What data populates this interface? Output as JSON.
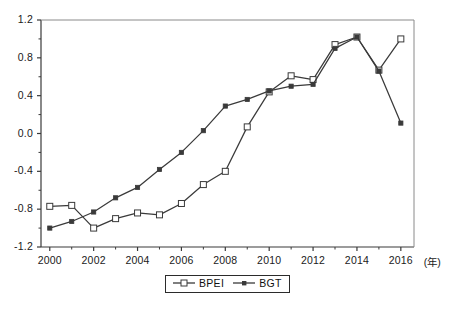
{
  "chart_data": {
    "type": "line",
    "title": "",
    "subtitle": "",
    "xlabel": "(年)",
    "ylabel": "",
    "x": [
      2000,
      2001,
      2002,
      2003,
      2004,
      2005,
      2006,
      2007,
      2008,
      2009,
      2010,
      2011,
      2012,
      2013,
      2014,
      2015,
      2016
    ],
    "xtick_labels": [
      "2000",
      "2002",
      "2004",
      "2006",
      "2008",
      "2010",
      "2012",
      "2014",
      "2016"
    ],
    "xtick_values": [
      2000,
      2002,
      2004,
      2006,
      2008,
      2010,
      2012,
      2014,
      2016
    ],
    "ytick_labels": [
      "1.2",
      "0.8",
      "0.4",
      "0.0",
      "-0.4",
      "-0.8",
      "-1.2"
    ],
    "ytick_values": [
      1.2,
      0.8,
      0.4,
      0.0,
      -0.4,
      -0.8,
      -1.2
    ],
    "xlim": [
      1999.6,
      2016.6
    ],
    "ylim": [
      -1.2,
      1.2
    ],
    "grid": false,
    "legend_position": "bottom-center",
    "series": [
      {
        "name": "BPEI",
        "marker": "open-square",
        "color": "#3a3a3a",
        "values": [
          -0.77,
          -0.76,
          -1.0,
          -0.9,
          -0.84,
          -0.86,
          -0.74,
          -0.54,
          -0.4,
          0.07,
          0.44,
          0.61,
          0.57,
          0.94,
          1.02,
          0.67,
          1.0
        ]
      },
      {
        "name": "BGT",
        "marker": "filled-square",
        "color": "#3a3a3a",
        "values": [
          -1.0,
          -0.93,
          -0.83,
          -0.68,
          -0.57,
          -0.38,
          -0.2,
          0.03,
          0.29,
          0.36,
          0.45,
          0.5,
          0.52,
          0.9,
          1.02,
          0.66,
          0.11
        ]
      }
    ]
  },
  "legend": {
    "items": [
      {
        "label": "BPEI"
      },
      {
        "label": "BGT"
      }
    ]
  },
  "axis": {
    "x_unit_label": "(年)"
  }
}
